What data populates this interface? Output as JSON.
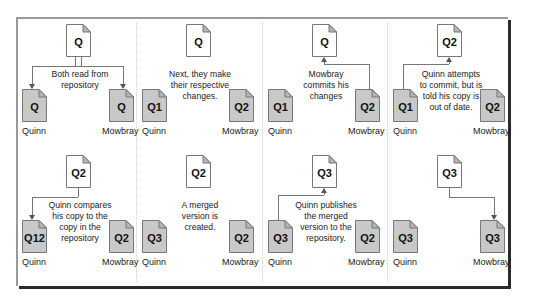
{
  "diagram": {
    "colors": {
      "repository_doc_fill": "#ffffff",
      "working_copy_fill": "#c8c8c8",
      "line": "#777777",
      "frame_shadow": "#2a2a2a"
    },
    "panels": [
      {
        "step": 1,
        "repository": {
          "label": "Q"
        },
        "quinn": {
          "label": "Q",
          "name": "Quinn"
        },
        "mowbray": {
          "label": "Q",
          "name": "Mowbray"
        },
        "caption": "Both read from\nrepository",
        "flow": "repository -> both"
      },
      {
        "step": 2,
        "repository": {
          "label": "Q"
        },
        "quinn": {
          "label": "Q1",
          "name": "Quinn"
        },
        "mowbray": {
          "label": "Q2",
          "name": "Mowbray"
        },
        "caption": "Next, they make\ntheir respective\nchanges.",
        "flow": "none"
      },
      {
        "step": 3,
        "repository": {
          "label": "Q"
        },
        "quinn": {
          "label": "Q1",
          "name": "Quinn"
        },
        "mowbray": {
          "label": "Q2",
          "name": "Mowbray"
        },
        "caption": "Mowbray\ncommits his\nchanges",
        "flow": "mowbray -> repository"
      },
      {
        "step": 4,
        "repository": {
          "label": "Q2"
        },
        "quinn": {
          "label": "Q1",
          "name": "Quinn"
        },
        "mowbray": {
          "label": "Q2",
          "name": "Mowbray"
        },
        "caption": "Quinn attempts\nto commit, but is\ntold his copy is\nout of date.",
        "flow": "quinn -> repository"
      },
      {
        "step": 5,
        "repository": {
          "label": "Q2"
        },
        "quinn": {
          "label": "Q12",
          "name": "Quinn"
        },
        "mowbray": {
          "label": "Q2",
          "name": "Mowbray"
        },
        "caption": "Quinn compares\nhis copy to the\ncopy in the\nrepository",
        "flow": "repository -> quinn"
      },
      {
        "step": 6,
        "repository": {
          "label": "Q2"
        },
        "quinn": {
          "label": "Q3",
          "name": "Quinn"
        },
        "mowbray": {
          "label": "Q2",
          "name": "Mowbray"
        },
        "caption": "A merged\nversion is\ncreated.",
        "flow": "none"
      },
      {
        "step": 7,
        "repository": {
          "label": "Q3"
        },
        "quinn": {
          "label": "Q3",
          "name": "Quinn"
        },
        "mowbray": {
          "label": "Q2",
          "name": "Mowbray"
        },
        "caption": "Quinn publishes\nthe merged\nversion to the\nrepository.",
        "flow": "quinn -> repository"
      },
      {
        "step": 8,
        "repository": {
          "label": "Q3"
        },
        "quinn": {
          "label": "Q3",
          "name": "Quinn"
        },
        "mowbray": {
          "label": "Q3",
          "name": "Mowbray"
        },
        "caption": "",
        "flow": "repository -> mowbray"
      }
    ]
  }
}
